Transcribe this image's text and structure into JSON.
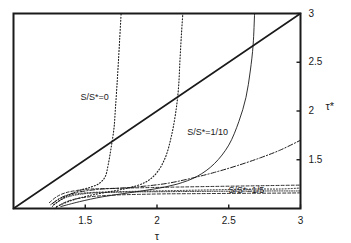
{
  "chart_data": {
    "type": "line",
    "title": "",
    "subtitle": "",
    "xlabel": "τ",
    "ylabel": "τ*",
    "xlim": [
      1,
      3
    ],
    "ylim": [
      1,
      3
    ],
    "grid": false,
    "legend_position": "inline-annotations",
    "xticks": [
      1.5,
      2,
      2.5,
      3
    ],
    "xticklabels": [
      "1.5",
      "2",
      "2.5",
      "3"
    ],
    "yticks": [
      1.5,
      2,
      2.5,
      3
    ],
    "yticklabels": [
      "1.5",
      "2",
      "2.5",
      "3"
    ],
    "yaxis_side": "right",
    "annotations": [
      {
        "text": "S/S*=0",
        "x": 1.62,
        "y": 2.13
      },
      {
        "text": "S/S*=1/10",
        "x": 2.42,
        "y": 1.77
      },
      {
        "text": "S/S*=1/5",
        "x": 2.68,
        "y": 1.18
      }
    ],
    "series": [
      {
        "name": "diagonal-identity",
        "label": "τ* = τ",
        "style": "solid",
        "width": 1.6,
        "color": "#1a1a1a",
        "points": [
          [
            1,
            1
          ],
          [
            3,
            3
          ]
        ]
      },
      {
        "name": "curve-S0-a",
        "label": "S/S*=0 branch 1",
        "style": "dotted",
        "width": 1.1,
        "color": "#1a1a1a",
        "points": [
          [
            1.28,
            1.04
          ],
          [
            1.34,
            1.1
          ],
          [
            1.4,
            1.15
          ],
          [
            1.47,
            1.19
          ],
          [
            1.54,
            1.22
          ],
          [
            1.6,
            1.26
          ],
          [
            1.64,
            1.33
          ],
          [
            1.66,
            1.45
          ],
          [
            1.68,
            1.62
          ],
          [
            1.7,
            1.82
          ],
          [
            1.71,
            2.02
          ],
          [
            1.72,
            2.24
          ],
          [
            1.73,
            2.48
          ],
          [
            1.74,
            2.74
          ],
          [
            1.75,
            3.0
          ]
        ]
      },
      {
        "name": "curve-S0-b",
        "label": "S/S*=0 branch 2",
        "style": "dotted",
        "width": 1.1,
        "color": "#1a1a1a",
        "points": [
          [
            1.3,
            1.02
          ],
          [
            1.4,
            1.08
          ],
          [
            1.52,
            1.13
          ],
          [
            1.66,
            1.17
          ],
          [
            1.8,
            1.21
          ],
          [
            1.92,
            1.27
          ],
          [
            2.0,
            1.37
          ],
          [
            2.06,
            1.53
          ],
          [
            2.1,
            1.74
          ],
          [
            2.13,
            1.98
          ],
          [
            2.15,
            2.24
          ],
          [
            2.16,
            2.52
          ],
          [
            2.17,
            2.78
          ],
          [
            2.18,
            3.0
          ]
        ]
      },
      {
        "name": "curve-S0-c",
        "label": "S/S*=0 branch 3",
        "style": "solid",
        "width": 0.9,
        "color": "#1a1a1a",
        "points": [
          [
            1.33,
            1.02
          ],
          [
            1.46,
            1.07
          ],
          [
            1.62,
            1.12
          ],
          [
            1.8,
            1.16
          ],
          [
            1.98,
            1.2
          ],
          [
            2.14,
            1.25
          ],
          [
            2.28,
            1.33
          ],
          [
            2.4,
            1.46
          ],
          [
            2.5,
            1.65
          ],
          [
            2.57,
            1.89
          ],
          [
            2.62,
            2.14
          ],
          [
            2.65,
            2.41
          ],
          [
            2.67,
            2.68
          ],
          [
            2.68,
            3.0
          ]
        ]
      },
      {
        "name": "curve-S10",
        "label": "S/S*=1/10",
        "style": "dashdot",
        "width": 1.0,
        "color": "#1a1a1a",
        "points": [
          [
            1.27,
            1.05
          ],
          [
            1.33,
            1.11
          ],
          [
            1.4,
            1.15
          ],
          [
            1.5,
            1.18
          ],
          [
            1.62,
            1.2
          ],
          [
            1.76,
            1.21
          ],
          [
            1.92,
            1.23
          ],
          [
            2.08,
            1.26
          ],
          [
            2.24,
            1.31
          ],
          [
            2.4,
            1.37
          ],
          [
            2.56,
            1.44
          ],
          [
            2.72,
            1.52
          ],
          [
            2.86,
            1.6
          ],
          [
            3.0,
            1.7
          ]
        ]
      },
      {
        "name": "curve-S5",
        "label": "S/S*=1/5",
        "style": "dotted",
        "width": 1.0,
        "color": "#1a1a1a",
        "points": [
          [
            1.26,
            1.04
          ],
          [
            1.32,
            1.1
          ],
          [
            1.4,
            1.14
          ],
          [
            1.5,
            1.16
          ],
          [
            1.64,
            1.17
          ],
          [
            1.8,
            1.175
          ],
          [
            1.98,
            1.18
          ],
          [
            2.16,
            1.185
          ],
          [
            2.34,
            1.19
          ],
          [
            2.52,
            1.195
          ],
          [
            2.7,
            1.2
          ],
          [
            2.86,
            1.2
          ],
          [
            3.0,
            1.21
          ]
        ]
      },
      {
        "name": "curve-band-1",
        "label": "dense band upper",
        "style": "dashed",
        "width": 0.9,
        "color": "#1a1a1a",
        "points": [
          [
            1.25,
            1.06
          ],
          [
            1.3,
            1.12
          ],
          [
            1.36,
            1.16
          ],
          [
            1.44,
            1.185
          ],
          [
            1.54,
            1.2
          ],
          [
            1.66,
            1.205
          ],
          [
            1.8,
            1.21
          ],
          [
            1.96,
            1.215
          ],
          [
            2.14,
            1.22
          ],
          [
            2.34,
            1.225
          ],
          [
            2.56,
            1.23
          ],
          [
            2.78,
            1.235
          ],
          [
            3.0,
            1.24
          ]
        ]
      },
      {
        "name": "curve-band-2",
        "label": "dense band mid",
        "style": "densedot",
        "width": 0.9,
        "color": "#1a1a1a",
        "points": [
          [
            1.27,
            1.02
          ],
          [
            1.32,
            1.08
          ],
          [
            1.38,
            1.12
          ],
          [
            1.46,
            1.145
          ],
          [
            1.56,
            1.16
          ],
          [
            1.68,
            1.165
          ],
          [
            1.82,
            1.17
          ],
          [
            1.98,
            1.172
          ],
          [
            2.16,
            1.174
          ],
          [
            2.36,
            1.176
          ],
          [
            2.58,
            1.178
          ],
          [
            2.8,
            1.18
          ],
          [
            3.0,
            1.18
          ]
        ]
      },
      {
        "name": "curve-band-3",
        "label": "dense band lower",
        "style": "dashed",
        "width": 0.9,
        "color": "#1a1a1a",
        "points": [
          [
            1.29,
            1.0
          ],
          [
            1.34,
            1.05
          ],
          [
            1.41,
            1.09
          ],
          [
            1.5,
            1.115
          ],
          [
            1.61,
            1.13
          ],
          [
            1.74,
            1.14
          ],
          [
            1.88,
            1.145
          ],
          [
            2.04,
            1.15
          ],
          [
            2.22,
            1.152
          ],
          [
            2.42,
            1.154
          ],
          [
            2.64,
            1.156
          ],
          [
            2.86,
            1.158
          ],
          [
            3.0,
            1.16
          ]
        ]
      }
    ]
  },
  "axes": {
    "x_title": "τ",
    "y_title": "τ*",
    "x_tick_labels": [
      "1.5",
      "2",
      "2.5",
      "3"
    ],
    "y_tick_labels": [
      "1.5",
      "2",
      "2.5",
      "3"
    ]
  },
  "labels": {
    "s0": "S/S*=0",
    "s10": "S/S*=1/10",
    "s5": "S/S*=1/5"
  },
  "colors": {
    "ink": "#1a1a1a",
    "background": "#ffffff"
  }
}
